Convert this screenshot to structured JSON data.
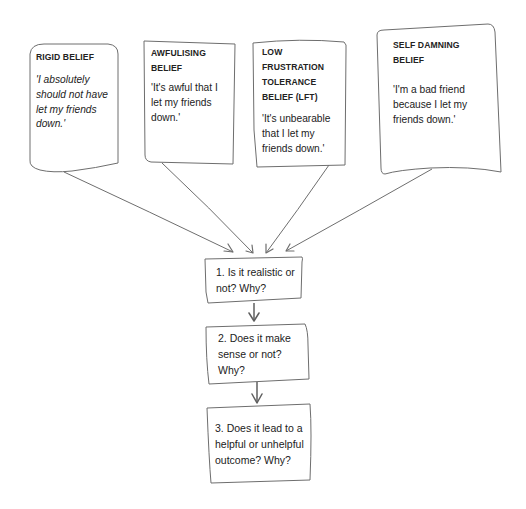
{
  "diagram": {
    "type": "flow",
    "colors": {
      "stroke": "#6e6e6e",
      "text": "#222222",
      "background": "#ffffff"
    },
    "beliefs": [
      {
        "title": "RIGID BELIEF",
        "quote": "'I absolutely should not have let my friends down.'",
        "quote_style": "italic"
      },
      {
        "title": "AWFULISING BELIEF",
        "quote": "'It's awful that I let my friends down.'",
        "quote_style": "normal"
      },
      {
        "title": "LOW FRUSTRATION TOLERANCE BELIEF (LFT)",
        "quote": "'It's unbearable that I let my friends down.'",
        "quote_style": "normal"
      },
      {
        "title": "SELF DAMNING BELIEF",
        "quote": "'I'm a bad friend because I let my friends down.'",
        "quote_style": "normal"
      }
    ],
    "questions": [
      {
        "text": "1. Is it realistic or not? Why?"
      },
      {
        "text": "2. Does it make sense or not? Why?"
      },
      {
        "text": "3. Does it lead to a helpful or unhelpful outcome? Why?"
      }
    ],
    "connections": [
      {
        "from": "belief-1",
        "to": "question-1"
      },
      {
        "from": "belief-2",
        "to": "question-1"
      },
      {
        "from": "belief-3",
        "to": "question-1"
      },
      {
        "from": "belief-4",
        "to": "question-1"
      },
      {
        "from": "question-1",
        "to": "question-2"
      },
      {
        "from": "question-2",
        "to": "question-3"
      }
    ]
  }
}
